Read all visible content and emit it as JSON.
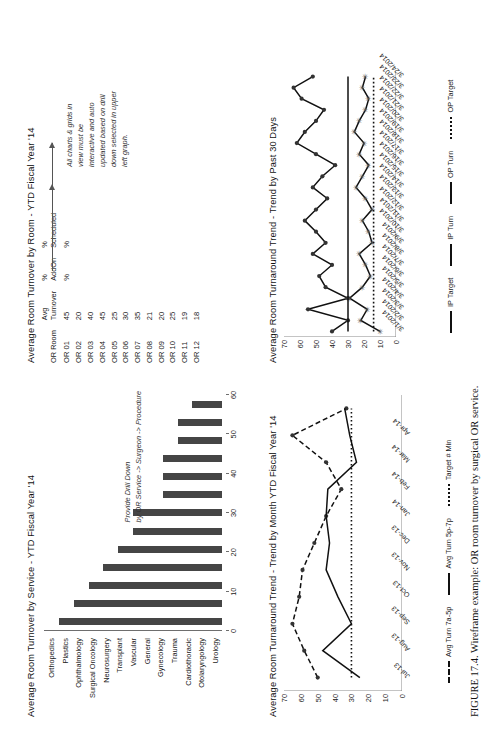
{
  "caption": "FIGURE 17.4. Wireframe example: OR room turnover by surgical OR service.",
  "bar_panel": {
    "title": "Average Room Turnover by Service - YTD Fiscal Year '14",
    "note_line1": "Provide Drill Down",
    "note_line2": "by OR Service -> Surgeon -> Procedure"
  },
  "table_panel": {
    "title": "Average Room Turnover by Room - YTD Fiscal Year '14",
    "headers": [
      "OR Room",
      "Avg Turnover",
      "% AddOn",
      "% Scheduled"
    ],
    "header_lines": [
      [
        "OR Room",
        ""
      ],
      [
        "Avg",
        "Turnover"
      ],
      [
        "%",
        "AddOn"
      ],
      [
        "%",
        "Scheduled"
      ]
    ],
    "rows": [
      {
        "room": "OR 01",
        "turnover": "45",
        "addon": "%",
        "sched": "%"
      },
      {
        "room": "OR 02",
        "turnover": "20",
        "addon": "",
        "sched": ""
      },
      {
        "room": "OR 03",
        "turnover": "40",
        "addon": "",
        "sched": ""
      },
      {
        "room": "OR 04",
        "turnover": "45",
        "addon": "",
        "sched": ""
      },
      {
        "room": "OR 05",
        "turnover": "25",
        "addon": "",
        "sched": ""
      },
      {
        "room": "OR 06",
        "turnover": "30",
        "addon": "",
        "sched": ""
      },
      {
        "room": "OR 07",
        "turnover": "35",
        "addon": "",
        "sched": ""
      },
      {
        "room": "OR 08",
        "turnover": "21",
        "addon": "",
        "sched": ""
      },
      {
        "room": "OR 09",
        "turnover": "20",
        "addon": "",
        "sched": ""
      },
      {
        "room": "OR 10",
        "turnover": "25",
        "addon": "",
        "sched": ""
      },
      {
        "room": "OR 11",
        "turnover": "19",
        "addon": "",
        "sched": ""
      },
      {
        "room": "OR 12",
        "turnover": "18",
        "addon": "",
        "sched": ""
      }
    ],
    "annotation": "All charts & grids in view must be interactive and auto updated based on drill down selected in upper left graph.",
    "annotation_lines": [
      "All charts & grids in",
      "view must be",
      "interactive and auto",
      "updated based on drill",
      "down selected in upper",
      "left graph."
    ]
  },
  "month_panel": {
    "title": "Average Room Turnaround Trend - Trend by Month YTD Fiscal Year '14",
    "legend": [
      "Avg Turn 7a-5p",
      "Avg Turn 5p-7p",
      "Target # Min"
    ]
  },
  "day_panel": {
    "title": "Average Room Turnaround Trend - Trend by Past 30 Days",
    "legend": [
      "IP Target",
      "IP Turn",
      "OP Turn",
      "OP Target"
    ]
  },
  "chart_data": [
    {
      "type": "bar",
      "title": "Average Room Turnover by Service - YTD Fiscal Year '14",
      "xlabel": "",
      "ylabel": "",
      "categories": [
        "Orthopedics",
        "Plastics",
        "Ophthalmology",
        "Surgical Oncology",
        "Neurosurgery",
        "Transplant",
        "Vascular",
        "General",
        "Gynecology",
        "Trauma",
        "Cardiothoracic",
        "Otolaryngology",
        "Urology"
      ],
      "values": [
        55,
        50,
        45,
        40,
        35,
        30,
        30,
        20,
        20,
        20,
        15,
        15,
        10
      ],
      "xlim": [
        0,
        60
      ],
      "xticks": [
        0,
        10,
        20,
        30,
        40,
        50,
        60
      ],
      "orientation": "vertical",
      "grid": false,
      "annotation": "Provide Drill Down by OR Service -> Surgeon -> Procedure"
    },
    {
      "type": "line",
      "title": "Average Room Turnaround Trend - Trend by Month YTD Fiscal Year '14",
      "xlabel": "",
      "ylabel": "",
      "categories": [
        "Jul-13",
        "Aug-13",
        "Sep-13",
        "Oct-13",
        "Nov-13",
        "Dec-13",
        "Jan-14",
        "Feb-14",
        "Mar-14",
        "Apr-14"
      ],
      "ylim": [
        0,
        70
      ],
      "yticks": [
        0,
        10,
        20,
        30,
        40,
        50,
        60,
        70
      ],
      "grid": false,
      "legend_position": "bottom",
      "series": [
        {
          "name": "Avg Turn 7a-5p",
          "style": "dashed-marker",
          "values": [
            50,
            58,
            65,
            61,
            59,
            52,
            45,
            36,
            45,
            65,
            33
          ]
        },
        {
          "name": "Avg Turn 5p-7p",
          "style": "solid",
          "values": [
            25,
            47,
            30,
            38,
            45,
            43,
            45,
            44,
            27,
            31,
            34
          ]
        },
        {
          "name": "Target # Min",
          "style": "dotted",
          "values": [
            30,
            30,
            30,
            30,
            30,
            30,
            30,
            30,
            30,
            30,
            30
          ]
        }
      ]
    },
    {
      "type": "line",
      "title": "Average Room Turnaround Trend - Trend by Past 30 Days",
      "xlabel": "",
      "ylabel": "",
      "categories": [
        "3/1/2014",
        "3/2/2014",
        "3/3/2014",
        "3/4/2014",
        "3/5/2014",
        "3/6/2014",
        "3/7/2014",
        "3/8/2014",
        "3/9/2014",
        "3/10/2014",
        "3/11/2014",
        "3/12/2014",
        "3/13/2014",
        "3/14/2014",
        "3/15/2014",
        "3/16/2014",
        "3/17/2014",
        "3/18/2014",
        "3/19/2014",
        "3/20/2014",
        "3/21/2014",
        "3/22/2014",
        "3/23/2014",
        "3/24/2014"
      ],
      "ylim": [
        0,
        70
      ],
      "yticks": [
        0,
        10,
        20,
        30,
        40,
        50,
        60,
        70
      ],
      "grid": false,
      "legend_position": "bottom",
      "series": [
        {
          "name": "IP Turn",
          "style": "solid-marker",
          "values": [
            40,
            30,
            55,
            30,
            44,
            48,
            40,
            52,
            44,
            50,
            57,
            50,
            43,
            52,
            46,
            38,
            50,
            62,
            57,
            50,
            45,
            59,
            64,
            52
          ]
        },
        {
          "name": "OP Turn",
          "style": "solid-star",
          "values": [
            10,
            22,
            18,
            29,
            21,
            16,
            19,
            23,
            15,
            17,
            21,
            15,
            19,
            25,
            21,
            17,
            23,
            20,
            26,
            23,
            19,
            17,
            21,
            19
          ]
        },
        {
          "name": "IP Target",
          "style": "solid",
          "values": [
            30,
            30,
            30,
            30,
            30,
            30,
            30,
            30,
            30,
            30,
            30,
            30,
            30,
            30,
            30,
            30,
            30,
            30,
            30,
            30,
            30,
            30,
            30,
            30
          ]
        },
        {
          "name": "OP Target",
          "style": "dotted",
          "values": [
            14,
            14,
            14,
            14,
            14,
            14,
            14,
            14,
            14,
            14,
            14,
            14,
            14,
            14,
            14,
            14,
            14,
            14,
            14,
            14,
            14,
            14,
            14,
            14
          ]
        }
      ]
    }
  ]
}
